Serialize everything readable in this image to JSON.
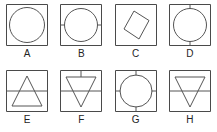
{
  "figure": {
    "title": "",
    "stroke_color": "#555555",
    "box_stroke_color": "#4a4a4a",
    "background_color": "#ffffff",
    "label_color": "#242424"
  },
  "panels": [
    {
      "label": "A",
      "shape": "circle",
      "box": "square",
      "ticks": [],
      "note": "circle inscribed in square, no tick marks"
    },
    {
      "label": "B",
      "shape": "circle",
      "box": "square",
      "ticks": [
        "left",
        "right"
      ],
      "note": "circle inscribed in square with horizontal tick marks on left and right sides"
    },
    {
      "label": "C",
      "shape": "rhombus",
      "box": "square",
      "ticks": [],
      "note": "slanted parallelogram / rhombus inside square"
    },
    {
      "label": "D",
      "shape": "circle",
      "box": "square",
      "ticks": [
        "top",
        "bottom"
      ],
      "note": "circle inscribed in square with vertical tick marks on top and bottom sides"
    },
    {
      "label": "E",
      "shape": "triangle-up",
      "box": "square",
      "ticks": [
        "left",
        "right"
      ],
      "note": "upward pointing triangle with horizontal line across middle"
    },
    {
      "label": "F",
      "shape": "triangle-down",
      "box": "square",
      "ticks": [
        "top",
        "left",
        "right"
      ],
      "note": "downward pointing triangle with horizontal mid line and vertical top tick"
    },
    {
      "label": "G",
      "shape": "circle",
      "box": "square",
      "ticks": [
        "top",
        "bottom",
        "left",
        "right"
      ],
      "note": "circle inscribed in square with tick marks on all four sides"
    },
    {
      "label": "H",
      "shape": "triangle-down",
      "box": "square",
      "ticks": [
        "left",
        "right"
      ],
      "note": "downward pointing triangle with horizontal line across middle"
    }
  ]
}
